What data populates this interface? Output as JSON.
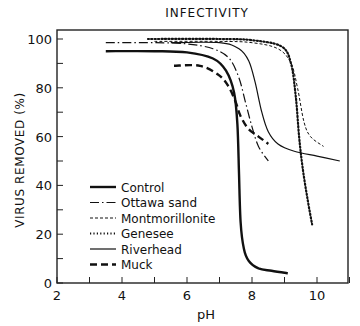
{
  "chart_data": {
    "type": "line",
    "title": "INFECTIVITY",
    "xlabel": "pH",
    "ylabel": "VIRUS REMOVED (%)",
    "xlim": [
      2,
      11
    ],
    "ylim": [
      0,
      105
    ],
    "xticks": [
      2,
      4,
      6,
      8,
      10
    ],
    "xtick_labels": [
      "2",
      "4",
      "6",
      "8",
      "10"
    ],
    "yticks": [
      0,
      20,
      40,
      60,
      80,
      100
    ],
    "ytick_labels": [
      "0",
      "20",
      "40",
      "60",
      "80",
      "100"
    ],
    "grid": false,
    "legend_position": "inside lower-left",
    "series": [
      {
        "name": "Control",
        "style": "thick-solid",
        "x": [
          3.5,
          5.0,
          6.0,
          6.8,
          7.2,
          7.45,
          7.55,
          7.6,
          7.65,
          7.75,
          7.9,
          8.2,
          8.6,
          9.1
        ],
        "y": [
          95,
          95,
          94.5,
          92,
          87,
          78,
          65,
          45,
          25,
          14,
          9,
          6,
          5,
          4
        ]
      },
      {
        "name": "Ottawa sand",
        "style": "dash-dot",
        "x": [
          3.5,
          5.0,
          6.0,
          6.8,
          7.3,
          7.6,
          7.8,
          8.0,
          8.2,
          8.5
        ],
        "y": [
          98.5,
          98.5,
          98,
          96,
          92,
          84,
          74,
          64,
          56,
          50
        ]
      },
      {
        "name": "Montmorillonite",
        "style": "fine-dashed",
        "x": [
          5.0,
          7.0,
          8.0,
          8.8,
          9.2,
          9.4,
          9.6,
          9.8,
          10.2
        ],
        "y": [
          99,
          99,
          98.5,
          96,
          90,
          80,
          66,
          60,
          56
        ]
      },
      {
        "name": "Genesee",
        "style": "dotted",
        "x": [
          4.8,
          7.0,
          8.0,
          8.9,
          9.2,
          9.35,
          9.45,
          9.55,
          9.7,
          9.85
        ],
        "y": [
          100,
          100,
          99.5,
          97,
          90,
          76,
          60,
          48,
          35,
          24
        ]
      },
      {
        "name": "Riverhead",
        "style": "thin-solid",
        "x": [
          5.5,
          7.0,
          7.6,
          7.9,
          8.1,
          8.3,
          8.5,
          8.8,
          9.3,
          10.0,
          10.7
        ],
        "y": [
          98.5,
          98.5,
          96,
          91,
          82,
          70,
          62,
          57,
          54,
          52,
          50
        ]
      },
      {
        "name": "Muck",
        "style": "thick-dashed",
        "x": [
          5.6,
          6.4,
          7.0,
          7.3,
          7.5,
          7.6,
          7.7,
          7.9,
          8.2,
          8.5
        ],
        "y": [
          89,
          89,
          85,
          80,
          74,
          70,
          67,
          63,
          60,
          57
        ]
      }
    ]
  },
  "legend": {
    "items": [
      "Control",
      "Ottawa sand",
      "Montmorillonite",
      "Genesee",
      "Riverhead",
      "Muck"
    ]
  }
}
